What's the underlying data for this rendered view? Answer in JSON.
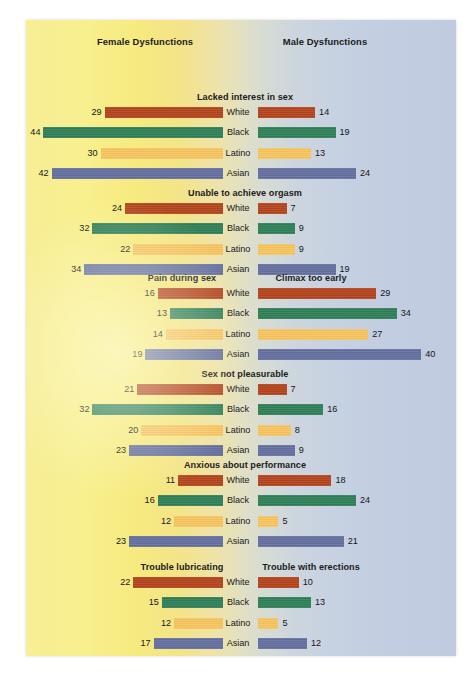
{
  "headers": {
    "female": "Female Dysfunctions",
    "male": "Male Dysfunctions"
  },
  "colors": {
    "white": "#b4441d",
    "black": "#2f8058",
    "latino": "#f8c560",
    "asian": "#6570a0",
    "bg_left": "#f7ee96",
    "bg_right": "#c0cbdf",
    "text": "#1b1b20"
  },
  "chart_data": {
    "type": "bar",
    "xlabel": "",
    "ylabel": "",
    "categories": [
      "White",
      "Black",
      "Latino",
      "Asian"
    ],
    "units": "percent",
    "xlim": [
      0,
      44
    ],
    "grid": false,
    "legend": "none",
    "layout": "paired horizontal bars, female values extend leftward, male values extend rightward",
    "sections": [
      {
        "female_title": "Lacked interest in sex",
        "male_title": "Lacked interest in sex",
        "shared_title": true,
        "female_values": [
          29,
          44,
          30,
          42
        ],
        "male_values": [
          14,
          19,
          13,
          24
        ]
      },
      {
        "female_title": "Unable to achieve orgasm",
        "male_title": "Unable to achieve orgasm",
        "shared_title": true,
        "female_values": [
          24,
          32,
          22,
          34
        ],
        "male_values": [
          7,
          9,
          9,
          19
        ]
      },
      {
        "female_title": "Pain during sex",
        "male_title": "Climax too early",
        "shared_title": false,
        "female_values": [
          16,
          13,
          14,
          19
        ],
        "male_values": [
          29,
          34,
          27,
          40
        ]
      },
      {
        "female_title": "Sex  not pleasurable",
        "male_title": "Sex  not pleasurable",
        "shared_title": true,
        "female_values": [
          21,
          32,
          20,
          23
        ],
        "male_values": [
          7,
          16,
          8,
          9
        ]
      },
      {
        "female_title": "Anxious about performance",
        "male_title": "Anxious about performance",
        "shared_title": true,
        "female_values": [
          11,
          16,
          12,
          23
        ],
        "male_values": [
          18,
          24,
          5,
          21
        ]
      },
      {
        "female_title": "Trouble lubricating",
        "male_title": "Trouble with erections",
        "shared_title": false,
        "female_values": [
          22,
          15,
          12,
          17
        ],
        "male_values": [
          10,
          13,
          5,
          12
        ]
      }
    ]
  }
}
